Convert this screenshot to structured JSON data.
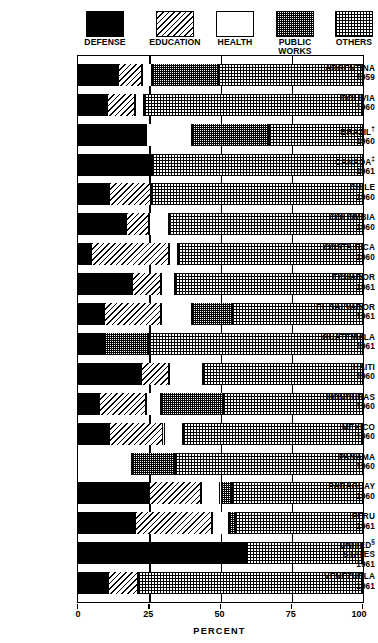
{
  "crop_title": "         ",
  "legend": {
    "items": [
      {
        "label": "DEFENSE",
        "key": "defense",
        "icon": "swatch-solid-black"
      },
      {
        "label": "EDUCATION",
        "key": "education",
        "icon": "swatch-diagonal-hatch"
      },
      {
        "label": "HEALTH",
        "key": "health",
        "icon": "swatch-white"
      },
      {
        "label": "PUBLIC\nWORKS",
        "key": "public",
        "icon": "swatch-dense-checker"
      },
      {
        "label": "OTHERS",
        "key": "others",
        "icon": "swatch-light-checker"
      }
    ]
  },
  "axis": {
    "ticks": [
      "0",
      "25",
      "50",
      "75",
      "100"
    ],
    "tick_values": [
      0,
      25,
      50,
      75,
      100
    ],
    "title": "PERCENT",
    "min": 0,
    "max": 100
  },
  "chart_data": {
    "type": "bar",
    "orientation": "horizontal",
    "stacked": true,
    "title": "",
    "xlabel": "PERCENT",
    "ylabel": "",
    "xlim": [
      0,
      100
    ],
    "grid": true,
    "legend_position": "top",
    "categories": [
      "ARGENTINA 1959",
      "BOLIVIA 1960",
      "BRAZIL 1960",
      "CANADA 1961",
      "CHILE 1960",
      "COLOMBIA 1960",
      "COSTA RICA 1960",
      "ECUADOR 1961",
      "EL SALVADOR 1961",
      "GUATEMALA 1961",
      "HAITI 1960",
      "HONDURAS 1960",
      "MEXICO 1960",
      "PANAMA 1960",
      "PARAGUAY 1960",
      "PERU 1961",
      "UNITED STATES 1961",
      "VENEZUELA 1961"
    ],
    "series": [
      {
        "name": "DEFENSE",
        "key": "defense",
        "values": [
          14,
          10,
          24,
          26,
          11,
          17,
          4.5,
          19,
          9,
          9,
          22,
          7.5,
          11,
          0,
          25,
          20,
          59,
          10.5
        ]
      },
      {
        "name": "EDUCATION",
        "key": "education",
        "values": [
          8.5,
          10,
          0,
          0,
          14.5,
          8,
          27.5,
          10,
          20,
          0,
          10,
          16.5,
          19,
          0,
          18,
          27,
          0,
          10.5
        ]
      },
      {
        "name": "HEALTH",
        "key": "health",
        "values": [
          3.5,
          3,
          16,
          0,
          0,
          7,
          3,
          5,
          11,
          0,
          12,
          5,
          7,
          19,
          7,
          6,
          0,
          0
        ]
      },
      {
        "name": "PUBLIC WORKS",
        "key": "public",
        "values": [
          23,
          0,
          27,
          0,
          0,
          0,
          0,
          0,
          14,
          16,
          0,
          22,
          0,
          15,
          4,
          2,
          0,
          0
        ]
      },
      {
        "name": "OTHERS",
        "key": "others",
        "values": [
          51,
          77,
          33,
          74,
          74.5,
          68,
          65,
          66,
          46,
          75,
          56,
          49,
          63,
          66,
          46,
          45,
          41,
          79
        ]
      }
    ]
  },
  "countries": [
    {
      "name": "ARGENTINA",
      "year": "1959",
      "footnote": ""
    },
    {
      "name": "BOLIVIA",
      "year": "1960",
      "footnote": ""
    },
    {
      "name": "BRAZIL",
      "year": "1960",
      "footnote": "†"
    },
    {
      "name": "CANADA",
      "year": "1961",
      "footnote": "‡"
    },
    {
      "name": "CHILE",
      "year": "1960",
      "footnote": ""
    },
    {
      "name": "COLOMBIA",
      "year": "1960",
      "footnote": ""
    },
    {
      "name": "COSTA RICA",
      "year": "1960",
      "footnote": ""
    },
    {
      "name": "ECUADOR",
      "year": "1961",
      "footnote": ""
    },
    {
      "name": "EL SALVADOR",
      "year": "1961",
      "footnote": ""
    },
    {
      "name": "GUATEMALA",
      "year": "1961",
      "footnote": ""
    },
    {
      "name": "HAITI",
      "year": "1960",
      "footnote": ""
    },
    {
      "name": "HONDURAS",
      "year": "1960",
      "footnote": ""
    },
    {
      "name": "MEXICO",
      "year": "1960",
      "footnote": ""
    },
    {
      "name": "PANAMA",
      "year": "1960",
      "footnote": ""
    },
    {
      "name": "PARAGUAY",
      "year": "1960",
      "footnote": ""
    },
    {
      "name": "PERU",
      "year": "1961",
      "footnote": ""
    },
    {
      "name": "UNITED STATES",
      "year": "1961",
      "footnote": "§",
      "twoline": true
    },
    {
      "name": "VENEZUELA",
      "year": "1961",
      "footnote": ""
    }
  ],
  "colors": {
    "ink": "#000000",
    "paper": "#ffffff"
  }
}
